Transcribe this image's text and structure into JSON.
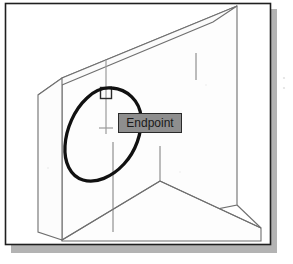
{
  "figure": {
    "caption_text": "",
    "application": "CAD isometric drawing view",
    "background_color": "#ffffff"
  },
  "frame": {
    "border_color": "#1f1f1f",
    "shadow_color": "#9a9a9a",
    "left": 5,
    "top": 3,
    "right": 271,
    "bottom": 245
  },
  "drawing": {
    "line_color": "#6f6f6f",
    "fill_color": "#fdfdfd",
    "wall": {
      "name": "isometric-wall-solid",
      "top_face": [
        [
          38,
          95
        ],
        [
          62,
          78
        ],
        [
          237,
          6
        ],
        [
          213,
          22
        ]
      ],
      "front_face": [
        [
          62,
          78
        ],
        [
          237,
          6
        ],
        [
          237,
          205
        ],
        [
          62,
          240
        ]
      ],
      "left_face": [
        [
          38,
          95
        ],
        [
          62,
          78
        ],
        [
          62,
          240
        ],
        [
          38,
          232
        ]
      ]
    },
    "floor": {
      "name": "isometric-floor-plane",
      "points": [
        [
          62,
          240
        ],
        [
          160,
          181
        ],
        [
          261,
          228
        ],
        [
          261,
          240
        ]
      ]
    },
    "edges": [
      {
        "name": "door-jamb-left-edge",
        "x1": 113,
        "y1": 142,
        "x2": 113,
        "y2": 230
      },
      {
        "name": "opening-right-edge",
        "x1": 196,
        "y1": 55,
        "x2": 196,
        "y2": 80
      },
      {
        "name": "floor-vertical-join",
        "x1": 160,
        "y1": 146,
        "x2": 160,
        "y2": 181
      }
    ]
  },
  "cursor": {
    "name": "crosshair-cursor",
    "color": "#9b9b9b",
    "center_x": 106,
    "center_y": 96,
    "vertical_top": 60,
    "vertical_bottom": 134,
    "tick_y": 128,
    "tick_half_width": 7
  },
  "snap_marker": {
    "name": "endpoint-snap-marker",
    "shape": "square",
    "color": "#2b2b2b",
    "x": 100,
    "y": 87,
    "size": 11
  },
  "tooltip": {
    "name": "osnap-tooltip",
    "label": "Endpoint",
    "background_color": "#8e8e8e",
    "border_color": "#2b2b2b",
    "text_color": "#1a1a1a",
    "x": 118,
    "y": 113,
    "width": 64,
    "height": 20
  },
  "annotation": {
    "name": "handdrawn-circle-annotation",
    "type": "ellipse",
    "stroke_color": "#111111",
    "stroke_width": 3.2,
    "center_x": 108,
    "center_y": 136,
    "radius_x": 38,
    "radius_y": 50,
    "rotation_deg": -28
  }
}
